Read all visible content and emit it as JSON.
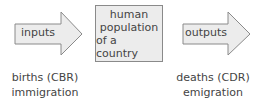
{
  "diagram": {
    "inputs_arrow": {
      "label": "inputs"
    },
    "center_box": {
      "lines": [
        "human",
        "population",
        "of a country"
      ]
    },
    "outputs_arrow": {
      "label": "outputs"
    },
    "input_captions": [
      "births (CBR)",
      "immigration"
    ],
    "output_captions": [
      "deaths (CDR)",
      "emigration"
    ]
  },
  "colors": {
    "fill": "#ececec",
    "stroke": "#8a8a8a",
    "text": "#444444"
  }
}
